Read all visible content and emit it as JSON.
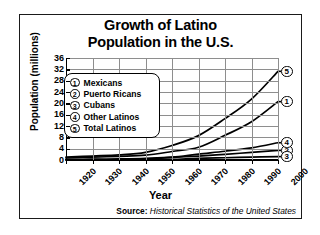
{
  "title": {
    "line1": "Growth of Latino",
    "line2": "Population in the U.S."
  },
  "axes": {
    "ylabel": "Population (millions)",
    "xlabel": "Year"
  },
  "source": {
    "lead": "Source:",
    "text": "Historical Statistics of the United States"
  },
  "legend": {
    "items": [
      {
        "num": "1",
        "label": "Mexicans"
      },
      {
        "num": "2",
        "label": "Puerto Ricans"
      },
      {
        "num": "3",
        "label": "Cubans"
      },
      {
        "num": "4",
        "label": "Other Latinos"
      },
      {
        "num": "5",
        "label": "Total Latinos"
      }
    ]
  },
  "end_markers": [
    {
      "num": "5"
    },
    {
      "num": "1"
    },
    {
      "num": "4"
    },
    {
      "num": "2"
    },
    {
      "num": "3"
    }
  ],
  "chart_data": {
    "type": "line",
    "title": "Growth of Latino Population in the U.S.",
    "xlabel": "Year",
    "ylabel": "Population (millions)",
    "xlim": [
      1920,
      2000
    ],
    "ylim": [
      0,
      36
    ],
    "ytick_step": 4,
    "xtick_step": 10,
    "grid": true,
    "legend_position": "upper-left-inside",
    "x": [
      1920,
      1930,
      1940,
      1950,
      1960,
      1970,
      1980,
      1990,
      2000
    ],
    "xticklabels": [
      "1920",
      "1930",
      "1940",
      "1950",
      "1960",
      "1970",
      "1980",
      "1990",
      "2000"
    ],
    "yticklabels": [
      "0",
      "4",
      "8",
      "12",
      "16",
      "20",
      "24",
      "28",
      "32",
      "36"
    ],
    "series": [
      {
        "name": "Mexicans",
        "marker_label": "1",
        "values": [
          0.7,
          1.0,
          1.3,
          1.7,
          3.0,
          4.5,
          8.7,
          13.5,
          20.6
        ]
      },
      {
        "name": "Puerto Ricans",
        "marker_label": "2",
        "values": [
          0.05,
          0.1,
          0.1,
          0.3,
          0.9,
          1.4,
          2.0,
          2.7,
          3.4
        ]
      },
      {
        "name": "Cubans",
        "marker_label": "3",
        "values": [
          0.02,
          0.03,
          0.04,
          0.08,
          0.2,
          0.6,
          0.8,
          1.0,
          1.2
        ]
      },
      {
        "name": "Other Latinos",
        "marker_label": "4",
        "values": [
          0.2,
          0.3,
          0.4,
          0.6,
          1.0,
          2.1,
          3.1,
          4.3,
          6.1
        ]
      },
      {
        "name": "Total Latinos",
        "marker_label": "5",
        "values": [
          1.0,
          1.4,
          1.8,
          2.7,
          5.1,
          8.6,
          14.6,
          21.5,
          31.3
        ]
      }
    ]
  }
}
